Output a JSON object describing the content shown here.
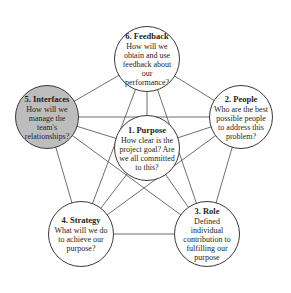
{
  "diagram": {
    "type": "network",
    "colors": {
      "line": "#4a4a4a",
      "node_border": "#3a3a3a",
      "highlight_fill": "#bdbdbd",
      "node_fill": "#ffffff"
    },
    "nodes": [
      {
        "id": "purpose",
        "number": "1",
        "title": "1. Purpose",
        "question": "How clear is the project goal? Are we all committed to this?",
        "cx": 147,
        "cy": 148,
        "r": 33,
        "highlight": false
      },
      {
        "id": "people",
        "number": "2",
        "title": "2. People",
        "question": "Who are the best possible people to address this problem?",
        "cx": 241,
        "cy": 117,
        "r": 32,
        "highlight": false
      },
      {
        "id": "role",
        "number": "3",
        "title": "3. Role",
        "question": "Defined individual contribution to fulfilling our purpose",
        "cx": 207,
        "cy": 234,
        "r": 33,
        "highlight": false
      },
      {
        "id": "strategy",
        "number": "4",
        "title": "4. Strategy",
        "question": "What will we do to achieve our purpose?",
        "cx": 81,
        "cy": 234,
        "r": 33,
        "highlight": false
      },
      {
        "id": "interfaces",
        "number": "5",
        "title": "5. Interfaces",
        "question": "How will we manage the team's relationships?",
        "cx": 47,
        "cy": 117,
        "r": 32,
        "highlight": true
      },
      {
        "id": "feedback",
        "number": "6",
        "title": "6. Feedback",
        "question": "How will we obtain and use feedback about our performance?",
        "cx": 147,
        "cy": 59,
        "r": 33,
        "highlight": false
      }
    ],
    "edges": [
      [
        "feedback",
        "people"
      ],
      [
        "people",
        "role"
      ],
      [
        "role",
        "strategy"
      ],
      [
        "strategy",
        "interfaces"
      ],
      [
        "interfaces",
        "feedback"
      ],
      [
        "feedback",
        "purpose"
      ],
      [
        "people",
        "purpose"
      ],
      [
        "role",
        "purpose"
      ],
      [
        "strategy",
        "purpose"
      ],
      [
        "interfaces",
        "purpose"
      ],
      [
        "feedback",
        "role"
      ],
      [
        "feedback",
        "strategy"
      ],
      [
        "people",
        "interfaces"
      ],
      [
        "people",
        "strategy"
      ],
      [
        "interfaces",
        "role"
      ]
    ]
  }
}
